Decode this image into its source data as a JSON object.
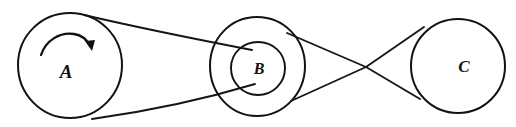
{
  "figure": {
    "background_color": "#ffffff",
    "ink_color": "#121212",
    "width": 516,
    "height": 127
  },
  "pulleys": [
    {
      "id": "A",
      "label": "A",
      "label_x": 66,
      "label_y": 74,
      "label_size": 19,
      "center_x": 70,
      "center_y": 65,
      "radius": 52,
      "has_inner_circle": false,
      "rotation_indicator": "clockwise-arc-arrow"
    },
    {
      "id": "B",
      "label": "B",
      "label_x": 259,
      "label_y": 70,
      "label_size": 16,
      "center_x": 257,
      "center_y": 65,
      "radius": 48,
      "has_inner_circle": true,
      "inner_radius": 27,
      "rotation_indicator": "none"
    },
    {
      "id": "C",
      "label": "C",
      "label_x": 464,
      "label_y": 68,
      "label_size": 17,
      "center_x": 458,
      "center_y": 66,
      "radius": 47,
      "has_inner_circle": false,
      "rotation_indicator": "none"
    }
  ],
  "belts": [
    {
      "id": "belt-A-B",
      "type": "open-belt",
      "from": "A",
      "to": "B",
      "crossed": false,
      "description": "open belt from large pulley A to outer rim of pulley B"
    },
    {
      "id": "belt-B-C",
      "type": "crossed-belt",
      "from": "B",
      "to": "C",
      "crossed": true,
      "crossing_x": 366,
      "crossing_y": 67,
      "description": "crossed belt from pulley B to pulley C"
    }
  ],
  "rotation_arrow": {
    "name": "clockwise-rotation-arrow",
    "pulley": "A",
    "direction": "clockwise"
  }
}
